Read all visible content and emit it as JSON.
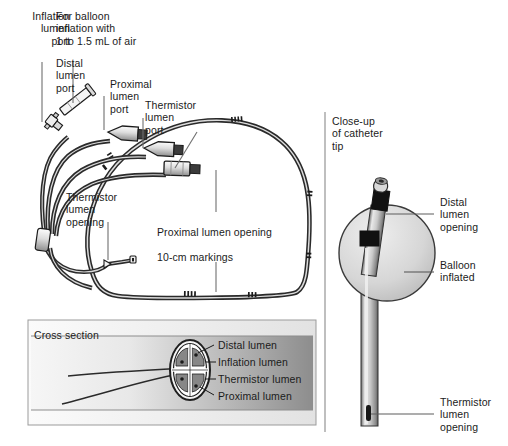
{
  "figure": {
    "background_color": "#ffffff",
    "ink_color": "#1b1b1b",
    "divider_color": "#8a8a8a"
  },
  "main_panel": {
    "labels": {
      "inflation_lumen_port": "Inflation\nlumen\nport",
      "balloon_inflation_note": "For balloon\ninflation with\n1 to 1.5 mL of air",
      "distal_lumen_port": "Distal\nlumen\nport",
      "proximal_lumen_port": "Proximal\nlumen\nport",
      "thermistor_lumen_port": "Thermistor\nlumen\nport",
      "thermistor_lumen_opening": "Thermistor\nlumen\nopening",
      "proximal_lumen_opening": "Proximal lumen opening",
      "ten_cm_markings": "10-cm markings"
    }
  },
  "cross_section_panel": {
    "title": "Cross section",
    "gradient_from": "#f4f4f4",
    "gradient_to": "#8d8d8d",
    "labels": [
      "Distal lumen",
      "Inflation lumen",
      "Thermistor lumen",
      "Proximal lumen"
    ]
  },
  "closeup_panel": {
    "title": "Close-up\nof catheter\ntip",
    "labels": {
      "distal_lumen_opening": "Distal\nlumen\nopening",
      "balloon_inflated": "Balloon\ninflated",
      "thermistor_lumen_opening": "Thermistor\nlumen\nopening"
    },
    "balloon_fill": "#d4d4d4",
    "shaft_fill": "#c9c9c9",
    "tip_band_color": "#1b1b1b"
  }
}
